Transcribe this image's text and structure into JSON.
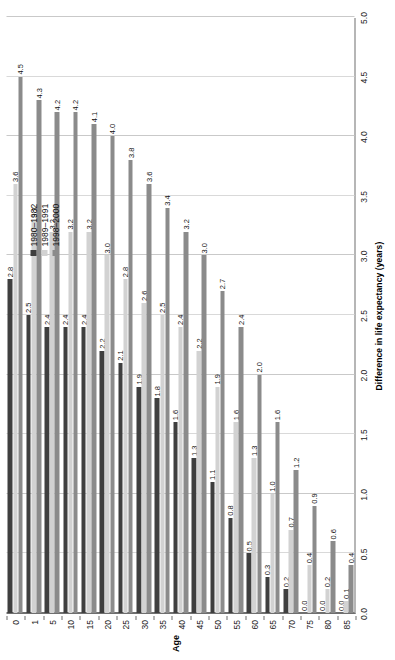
{
  "chart_data": {
    "type": "bar",
    "orientation": "horizontal",
    "title": "",
    "xlabel": "Difference in life expectancy (years)",
    "ylabel": "Age",
    "xlim": [
      0.0,
      5.0
    ],
    "xticks": [
      "0.0",
      "0.5",
      "1.0",
      "1.5",
      "2.0",
      "2.5",
      "3.0",
      "3.5",
      "4.0",
      "4.5",
      "5.0"
    ],
    "xtick_values": [
      0.0,
      0.5,
      1.0,
      1.5,
      2.0,
      2.5,
      3.0,
      3.5,
      4.0,
      4.5,
      5.0
    ],
    "grid": true,
    "grid_axis": "x",
    "legend_position": "upper-left",
    "categories": [
      "0",
      "1",
      "5",
      "10",
      "15",
      "20",
      "25",
      "30",
      "35",
      "40",
      "45",
      "50",
      "55",
      "60",
      "65",
      "70",
      "75",
      "80",
      "85"
    ],
    "series": [
      {
        "name": "1980–1982",
        "color": "#3f3f3f",
        "values": [
          2.8,
          2.5,
          2.4,
          2.4,
          2.4,
          2.2,
          2.1,
          1.9,
          1.8,
          1.6,
          1.3,
          1.1,
          0.8,
          0.5,
          0.3,
          0.2,
          0.0,
          0.0,
          0.0
        ],
        "labels": [
          "2.8",
          "2.5",
          "2.4",
          "2.4",
          "2.4",
          "2.2",
          "2.1",
          "1.9",
          "1.8",
          "1.6",
          "1.3",
          "1.1",
          "0.8",
          "0.5",
          "0.3",
          "0.2",
          "0.0",
          "0.0",
          "0.0"
        ]
      },
      {
        "name": "1989–1991",
        "color": "#d2d2d2",
        "values": [
          3.6,
          3.3,
          3.2,
          3.2,
          3.2,
          3.0,
          2.8,
          2.6,
          2.5,
          2.4,
          2.2,
          1.9,
          1.6,
          1.3,
          1.0,
          0.7,
          0.4,
          0.2,
          0.1
        ],
        "labels": [
          "3.6",
          "3.3",
          "3.2",
          "3.2",
          "3.2",
          "3.0",
          "2.8",
          "2.6",
          "2.5",
          "2.4",
          "2.2",
          "1.9",
          "1.6",
          "1.3",
          "1.0",
          "0.7",
          "0.4",
          "0.2",
          "0.1"
        ]
      },
      {
        "name": "1998–2000",
        "color": "#8b8b8b",
        "values": [
          4.5,
          4.3,
          4.2,
          4.2,
          4.1,
          4.0,
          3.8,
          3.6,
          3.4,
          3.2,
          3.0,
          2.7,
          2.4,
          2.0,
          1.6,
          1.2,
          0.9,
          0.6,
          0.4
        ],
        "labels": [
          "4.5",
          "4.3",
          "4.2",
          "4.2",
          "4.1",
          "4.0",
          "3.8",
          "3.6",
          "3.4",
          "3.2",
          "3.0",
          "2.7",
          "2.4",
          "2.0",
          "1.6",
          "1.2",
          "0.9",
          "0.6",
          "0.4"
        ]
      }
    ]
  },
  "legend": {
    "items": [
      {
        "label": "1980–1982",
        "color": "#3f3f3f"
      },
      {
        "label": "1989–1991",
        "color": "#d2d2d2"
      },
      {
        "label": "1998–2000",
        "color": "#8b8b8b"
      }
    ]
  },
  "axes": {
    "value_axis_title": "Difference in life expectancy (years)",
    "category_axis_title": "Age"
  }
}
